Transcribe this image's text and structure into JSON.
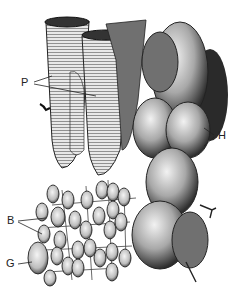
{
  "figure": {
    "labels": {
      "p": "P",
      "h": "H",
      "b": "B",
      "g": "G"
    },
    "colors": {
      "background": "#ffffff",
      "ink": "#1a1a1a",
      "mid": "#7a7a7a",
      "light": "#d6d6d6"
    }
  }
}
